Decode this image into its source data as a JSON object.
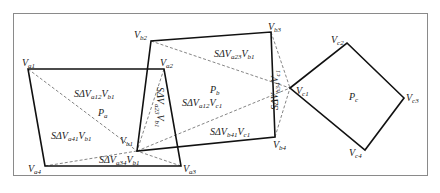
{
  "diagram": {
    "polygons": [
      {
        "id": "Pa",
        "label": {
          "base": "P",
          "sub": "a"
        },
        "vertices": [
          "Va1",
          "Va2",
          "Va3",
          "Va4"
        ]
      },
      {
        "id": "Pb",
        "label": {
          "base": "P",
          "sub": "b"
        },
        "vertices": [
          "Vb1",
          "Vb2",
          "Vb3",
          "Vb4"
        ]
      },
      {
        "id": "Pc",
        "label": {
          "base": "P",
          "sub": "c"
        },
        "vertices": [
          "Vc1",
          "Vc2",
          "Vc3",
          "Vc4"
        ]
      }
    ],
    "vertices": {
      "Va1": {
        "base": "V",
        "sub": "a1"
      },
      "Va2": {
        "base": "V",
        "sub": "a2"
      },
      "Va3": {
        "base": "V",
        "sub": "a3"
      },
      "Va4": {
        "base": "V",
        "sub": "a4"
      },
      "Vb1": {
        "base": "V",
        "sub": "b1"
      },
      "Vb2": {
        "base": "V",
        "sub": "b2"
      },
      "Vb3": {
        "base": "V",
        "sub": "b3"
      },
      "Vb4": {
        "base": "V",
        "sub": "b4"
      },
      "Vc1": {
        "base": "V",
        "sub": "c1"
      },
      "Vc2": {
        "base": "V",
        "sub": "c2"
      },
      "Vc3": {
        "base": "V",
        "sub": "c3"
      },
      "Vc4": {
        "base": "V",
        "sub": "c4"
      }
    },
    "triangle_labels": [
      {
        "prefix": "SΔV",
        "sub1": "a12",
        "mid": "V",
        "sub2": "b1"
      },
      {
        "prefix": "SΔV",
        "sub1": "a41",
        "mid": "V",
        "sub2": "b1"
      },
      {
        "prefix": "SΔV",
        "sub1": "a34",
        "mid": "V",
        "sub2": "b1"
      },
      {
        "prefix": "SΔV",
        "sub1": "a23",
        "mid": "V",
        "sub2": "b1"
      },
      {
        "prefix": "SΔV",
        "sub1": "a23",
        "mid": "V",
        "sub2": "b1"
      },
      {
        "prefix": "SΔV",
        "sub1": "a12",
        "mid": "V",
        "sub2": "c1"
      },
      {
        "prefix": "SΔV",
        "sub1": "b41",
        "mid": "V",
        "sub2": "c1"
      },
      {
        "prefix": "SΔV",
        "sub1": "b34",
        "mid": "V",
        "sub2": "c1"
      }
    ]
  }
}
